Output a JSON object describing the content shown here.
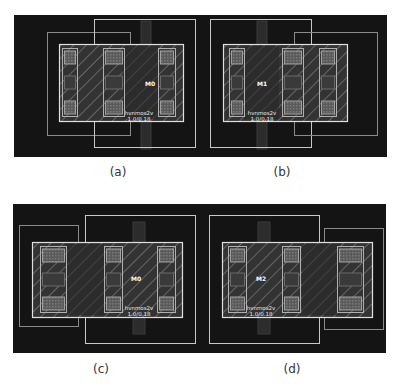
{
  "figure": {
    "background": "#ffffff",
    "layout_bg": "#141414",
    "line_color": "#bdbdbd",
    "hatch_color": "#9a9a9a",
    "contact_fill": "#5a5a5a",
    "gate_fill": "#262626",
    "strips": [
      {
        "x": 14,
        "y": 15,
        "w": 373,
        "h": 142
      },
      {
        "x": 13,
        "y": 204,
        "w": 373,
        "h": 149
      }
    ],
    "panels": [
      {
        "id": "a",
        "caption": "(a)",
        "caption_x": 118,
        "caption_y": 165,
        "ox": 14,
        "oy": 15,
        "outer_boxes": [
          {
            "x": 33,
            "y": 17,
            "w": 83,
            "h": 103
          },
          {
            "x": 80,
            "y": 4,
            "w": 101,
            "h": 128
          }
        ],
        "poly": {
          "x": 127,
          "y": 6,
          "w": 10,
          "h": 128
        },
        "diffusion": {
          "x": 45,
          "y": 29,
          "w": 124,
          "h": 77
        },
        "gate": {
          "x": 109,
          "y": 31,
          "w": 35,
          "h": 73
        },
        "contact_cols": [
          {
            "x": 48,
            "w": 15
          },
          {
            "x": 89,
            "w": 21
          },
          {
            "x": 144,
            "w": 17
          }
        ],
        "id_label": {
          "text": "M0",
          "x": 136,
          "y": 71
        },
        "device_label": {
          "line1": "hvnmos2v",
          "line2": "1.0/0.18",
          "x": 125,
          "y": 100
        }
      },
      {
        "id": "b",
        "caption": "(b)",
        "caption_x": 282,
        "caption_y": 165,
        "ox": 14,
        "oy": 15,
        "outer_boxes": [
          {
            "x": 196,
            "y": 4,
            "w": 101,
            "h": 128
          },
          {
            "x": 280,
            "y": 17,
            "w": 83,
            "h": 103
          }
        ],
        "poly": {
          "x": 243,
          "y": 6,
          "w": 10,
          "h": 128
        },
        "diffusion": {
          "x": 209,
          "y": 29,
          "w": 124,
          "h": 77
        },
        "gate": {
          "x": 230,
          "y": 31,
          "w": 35,
          "h": 73
        },
        "contact_cols": [
          {
            "x": 215,
            "w": 15
          },
          {
            "x": 268,
            "w": 21
          },
          {
            "x": 305,
            "w": 17
          }
        ],
        "id_label": {
          "text": "M1",
          "x": 248,
          "y": 71
        },
        "device_label": {
          "line1": "hvnmos2v",
          "line2": "1.0/0.18",
          "x": 248,
          "y": 100
        }
      },
      {
        "id": "c",
        "caption": "(c)",
        "caption_x": 101,
        "caption_y": 362,
        "ox": 13,
        "oy": 204,
        "outer_boxes": [
          {
            "x": 6,
            "y": 21,
            "w": 59,
            "h": 101
          },
          {
            "x": 72,
            "y": 11,
            "w": 110,
            "h": 128
          }
        ],
        "poly": {
          "x": 120,
          "y": 18,
          "w": 12,
          "h": 112
        },
        "diffusion": {
          "x": 19,
          "y": 38,
          "w": 150,
          "h": 75
        },
        "gate": {
          "x": 53,
          "y": 40,
          "w": 38,
          "h": 71
        },
        "contact_cols": [
          {
            "x": 27,
            "w": 26
          },
          {
            "x": 91,
            "w": 18
          },
          {
            "x": 144,
            "w": 18
          }
        ],
        "id_label": {
          "text": "M0",
          "x": 123,
          "y": 77
        },
        "device_label": {
          "line1": "hvnmos2v",
          "line2": "1.0/0.18",
          "x": 126,
          "y": 106
        }
      },
      {
        "id": "d",
        "caption": "(d)",
        "caption_x": 292,
        "caption_y": 362,
        "ox": 13,
        "oy": 204,
        "outer_boxes": [
          {
            "x": 196,
            "y": 11,
            "w": 110,
            "h": 128
          },
          {
            "x": 311,
            "y": 24,
            "w": 59,
            "h": 101
          }
        ],
        "poly": {
          "x": 245,
          "y": 18,
          "w": 12,
          "h": 112
        },
        "diffusion": {
          "x": 209,
          "y": 38,
          "w": 150,
          "h": 75
        },
        "gate": {
          "x": 289,
          "y": 40,
          "w": 38,
          "h": 71
        },
        "contact_cols": [
          {
            "x": 215,
            "w": 18
          },
          {
            "x": 269,
            "w": 18
          },
          {
            "x": 324,
            "w": 26
          }
        ],
        "id_label": {
          "text": "M2",
          "x": 248,
          "y": 77
        },
        "device_label": {
          "line1": "hvnmos2v",
          "line2": "1.0/0.18",
          "x": 248,
          "y": 106
        }
      }
    ]
  }
}
